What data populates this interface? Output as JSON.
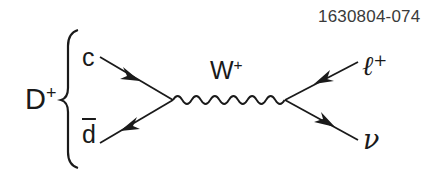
{
  "figure_id": "1630804-074",
  "meson": {
    "symbol": "D",
    "charge": "+"
  },
  "quarks": [
    {
      "symbol": "c",
      "antiparticle": false
    },
    {
      "symbol": "d",
      "antiparticle": true
    }
  ],
  "boson": {
    "symbol": "W",
    "charge": "+"
  },
  "leptons": [
    {
      "symbol": "ℓ",
      "charge": "+"
    },
    {
      "symbol": "ν",
      "charge": ""
    }
  ],
  "colors": {
    "ink": "#1a1a1a",
    "background": "#ffffff",
    "label_gray": "#3a3a3a"
  }
}
